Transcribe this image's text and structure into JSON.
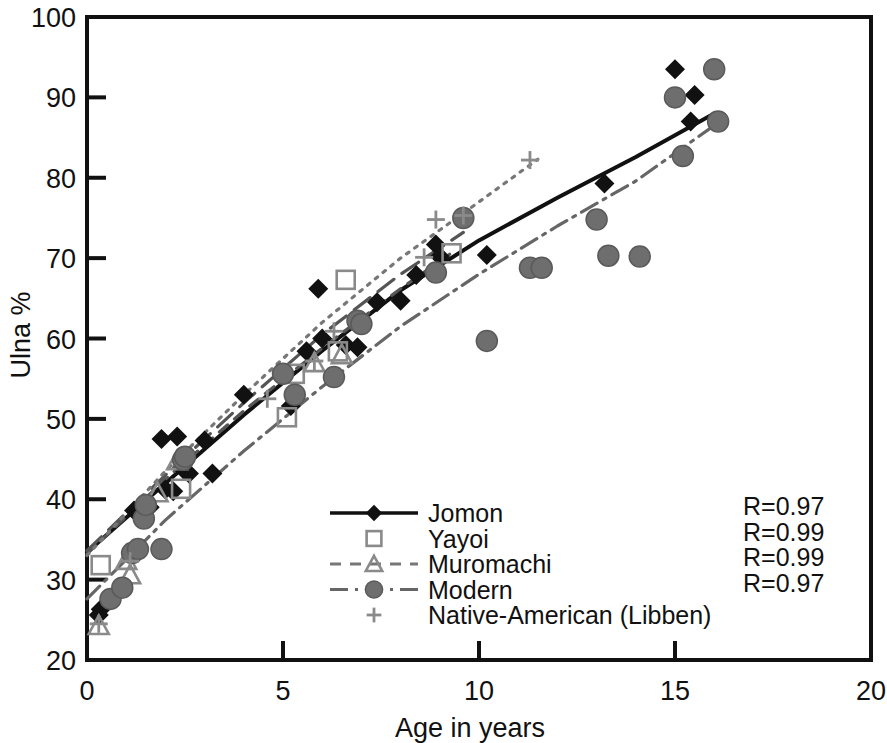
{
  "chart_data": {
    "type": "scatter",
    "title": "",
    "xlabel": "Age in years",
    "ylabel": "Ulna %",
    "xlim": [
      0,
      20
    ],
    "ylim": [
      20,
      100
    ],
    "xticks": [
      0,
      5,
      10,
      15,
      20
    ],
    "yticks": [
      20,
      30,
      40,
      50,
      60,
      70,
      80,
      90,
      100
    ],
    "xtick_labels": [
      "0",
      "5",
      "10",
      "15",
      "20"
    ],
    "ytick_labels": [
      "20",
      "30",
      "40",
      "50",
      "60",
      "70",
      "80",
      "90",
      "100"
    ],
    "grid": false,
    "legend_position": "center",
    "series": [
      {
        "name": "Jomon",
        "marker": "filled-diamond",
        "line_style": "solid",
        "color": "#111111",
        "points": [
          [
            0.3,
            25.6
          ],
          [
            0.35,
            26.3
          ],
          [
            1.2,
            38.6
          ],
          [
            1.6,
            39.0
          ],
          [
            1.9,
            47.5
          ],
          [
            2.3,
            47.8
          ],
          [
            2.0,
            41.2
          ],
          [
            2.2,
            41.0
          ],
          [
            2.45,
            44.6
          ],
          [
            2.5,
            43.5
          ],
          [
            2.6,
            43.2
          ],
          [
            3.0,
            47.3
          ],
          [
            3.2,
            43.2
          ],
          [
            4.0,
            53.0
          ],
          [
            5.2,
            51.6
          ],
          [
            5.6,
            58.4
          ],
          [
            5.9,
            66.2
          ],
          [
            6.0,
            60.0
          ],
          [
            6.6,
            59.2
          ],
          [
            6.9,
            58.9
          ],
          [
            7.4,
            64.5
          ],
          [
            8.0,
            64.7
          ],
          [
            8.4,
            67.9
          ],
          [
            8.9,
            71.7
          ],
          [
            9.0,
            70.2
          ],
          [
            10.2,
            70.4
          ],
          [
            13.2,
            79.3
          ],
          [
            15.0,
            93.5
          ],
          [
            15.5,
            90.3
          ],
          [
            15.4,
            87.0
          ]
        ],
        "fit_R": "R=0.97"
      },
      {
        "name": "Yayoi",
        "marker": "open-square",
        "line_style": "long-dash",
        "color": "#555555",
        "points": [
          [
            0.35,
            31.8
          ],
          [
            2.4,
            41.3
          ],
          [
            5.1,
            50.2
          ],
          [
            5.3,
            55.6
          ],
          [
            6.4,
            58.4
          ],
          [
            6.6,
            67.3
          ],
          [
            9.3,
            70.6
          ]
        ],
        "fit_R": "R=0.99"
      },
      {
        "name": "Muromachi",
        "marker": "open-triangle",
        "line_style": "dashed",
        "color": "#555555",
        "points": [
          [
            0.3,
            24.3
          ],
          [
            1.0,
            32.4
          ],
          [
            1.1,
            30.6
          ],
          [
            1.8,
            40.8
          ],
          [
            2.3,
            44.8
          ],
          [
            5.8,
            57.0
          ],
          [
            6.5,
            58.0
          ]
        ],
        "fit_R": "R=0.99"
      },
      {
        "name": "Modern",
        "marker": "filled-circle",
        "line_style": "dash-dot",
        "color": "#666666",
        "points": [
          [
            0.6,
            27.6
          ],
          [
            0.9,
            29.0
          ],
          [
            1.15,
            33.3
          ],
          [
            1.3,
            33.8
          ],
          [
            1.45,
            37.6
          ],
          [
            1.5,
            39.3
          ],
          [
            1.9,
            33.8
          ],
          [
            2.45,
            44.9
          ],
          [
            2.5,
            45.3
          ],
          [
            5.0,
            55.6
          ],
          [
            5.3,
            53.0
          ],
          [
            6.3,
            55.2
          ],
          [
            6.9,
            62.2
          ],
          [
            7.0,
            61.8
          ],
          [
            8.9,
            68.2
          ],
          [
            9.6,
            75.0
          ],
          [
            10.2,
            59.7
          ],
          [
            11.3,
            68.8
          ],
          [
            11.6,
            68.8
          ],
          [
            13.0,
            74.8
          ],
          [
            13.3,
            70.3
          ],
          [
            14.1,
            70.2
          ],
          [
            15.0,
            90.0
          ],
          [
            15.2,
            82.7
          ],
          [
            16.0,
            93.5
          ],
          [
            16.1,
            87.0
          ]
        ],
        "fit_R": "R=0.97"
      },
      {
        "name": "Native-American (Libben)",
        "marker": "plus",
        "line_style": "dotted",
        "color": "#777777",
        "points": [
          [
            0.3,
            24.5
          ],
          [
            1.1,
            32.3
          ],
          [
            4.6,
            52.5
          ],
          [
            5.8,
            57.2
          ],
          [
            6.3,
            60.9
          ],
          [
            8.6,
            70.1
          ],
          [
            8.9,
            74.8
          ],
          [
            9.6,
            75.3
          ],
          [
            11.3,
            82.2
          ]
        ],
        "fit_R": "R=0.99"
      }
    ],
    "annotations": [
      "R=0.97",
      "R=0.99",
      "R=0.99",
      "R=0.97"
    ],
    "trend_curves": [
      {
        "name": "Jomon",
        "style": "solid",
        "path": [
          [
            0.0,
            33.4
          ],
          [
            2.0,
            42.0
          ],
          [
            4.0,
            50.5
          ],
          [
            6.0,
            58.5
          ],
          [
            8.0,
            66.0
          ],
          [
            10.0,
            72.2
          ],
          [
            12.0,
            77.5
          ],
          [
            14.0,
            82.6
          ],
          [
            16.0,
            88.0
          ]
        ]
      },
      {
        "name": "Yayoi",
        "style": "long-dash",
        "path": [
          [
            0.0,
            33.6
          ],
          [
            2.0,
            43.0
          ],
          [
            4.0,
            52.0
          ],
          [
            6.0,
            60.5
          ],
          [
            8.0,
            68.0
          ],
          [
            9.6,
            73.2
          ]
        ]
      },
      {
        "name": "Muromachi",
        "style": "dashed",
        "path": [
          [
            0.0,
            33.2
          ],
          [
            2.0,
            42.5
          ],
          [
            4.0,
            51.0
          ],
          [
            6.0,
            58.8
          ],
          [
            8.0,
            66.2
          ],
          [
            9.4,
            71.0
          ]
        ]
      },
      {
        "name": "Modern",
        "style": "dash-dot",
        "path": [
          [
            0.0,
            27.6
          ],
          [
            2.0,
            37.4
          ],
          [
            4.0,
            46.0
          ],
          [
            6.0,
            54.0
          ],
          [
            8.0,
            61.5
          ],
          [
            10.0,
            68.0
          ],
          [
            12.0,
            74.0
          ],
          [
            14.0,
            79.6
          ],
          [
            16.0,
            86.5
          ]
        ]
      },
      {
        "name": "Native-American (Libben)",
        "style": "dotted",
        "path": [
          [
            0.0,
            33.0
          ],
          [
            2.0,
            43.5
          ],
          [
            4.0,
            53.0
          ],
          [
            6.0,
            62.0
          ],
          [
            8.0,
            70.0
          ],
          [
            10.0,
            77.0
          ],
          [
            11.5,
            82.3
          ]
        ]
      }
    ]
  },
  "legend": {
    "items": [
      {
        "label": "Jomon",
        "marker": "filled-diamond",
        "line": "solid"
      },
      {
        "label": "Yayoi",
        "marker": "open-square",
        "line": "none"
      },
      {
        "label": "Muromachi",
        "marker": "open-triangle",
        "line": "dashed"
      },
      {
        "label": "Modern",
        "marker": "filled-circle",
        "line": "dash-dot"
      },
      {
        "label": "Native-American (Libben)",
        "marker": "plus",
        "line": "none"
      }
    ]
  },
  "r_values": [
    "R=0.97",
    "R=0.99",
    "R=0.99",
    "R=0.97"
  ],
  "axes": {
    "x_title": "Age in years",
    "y_title": "Ulna %"
  }
}
